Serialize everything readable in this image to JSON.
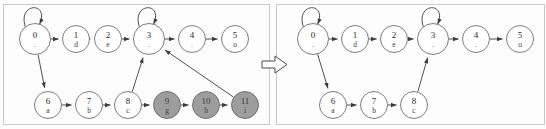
{
  "figure": {
    "title": "",
    "transition_symbol": "right-arrow",
    "panels": [
      {
        "id": "before",
        "name": "left-panel",
        "nodes": [
          {
            "id": "0",
            "label": "0",
            "sub": ".",
            "x": 31,
            "y": 34,
            "r": 15.5,
            "gray": false,
            "self_loop": true
          },
          {
            "id": "1",
            "label": "1",
            "sub": "d",
            "x": 72,
            "y": 34,
            "r": 13.5,
            "gray": false,
            "self_loop": false
          },
          {
            "id": "2",
            "label": "2",
            "sub": "e",
            "x": 104,
            "y": 34,
            "r": 13.5,
            "gray": false,
            "self_loop": false
          },
          {
            "id": "3",
            "label": "3",
            "sub": ".",
            "x": 145,
            "y": 34,
            "r": 15.5,
            "gray": false,
            "self_loop": true
          },
          {
            "id": "4",
            "label": "4",
            "sub": ".",
            "x": 188,
            "y": 34,
            "r": 13.5,
            "gray": false,
            "self_loop": false
          },
          {
            "id": "5",
            "label": "5",
            "sub": "o",
            "x": 231,
            "y": 34,
            "r": 13.5,
            "gray": false,
            "self_loop": false
          },
          {
            "id": "6",
            "label": "6",
            "sub": "a",
            "x": 44,
            "y": 100,
            "r": 13.5,
            "gray": false,
            "self_loop": false
          },
          {
            "id": "7",
            "label": "7",
            "sub": "b",
            "x": 85,
            "y": 100,
            "r": 13.5,
            "gray": false,
            "self_loop": false
          },
          {
            "id": "8",
            "label": "8",
            "sub": "c",
            "x": 124,
            "y": 100,
            "r": 13.5,
            "gray": false,
            "self_loop": false
          },
          {
            "id": "9",
            "label": "9",
            "sub": "g",
            "x": 163,
            "y": 100,
            "r": 13.5,
            "gray": true,
            "self_loop": false
          },
          {
            "id": "10",
            "label": "10",
            "sub": "h",
            "x": 202,
            "y": 100,
            "r": 13.5,
            "gray": true,
            "self_loop": false
          },
          {
            "id": "11",
            "label": "11",
            "sub": "i",
            "x": 241,
            "y": 100,
            "r": 13.5,
            "gray": true,
            "self_loop": false
          }
        ],
        "edges": [
          {
            "from": "0",
            "to": "1"
          },
          {
            "from": "1",
            "to": "2"
          },
          {
            "from": "2",
            "to": "3"
          },
          {
            "from": "3",
            "to": "4"
          },
          {
            "from": "4",
            "to": "5"
          },
          {
            "from": "0",
            "to": "6"
          },
          {
            "from": "6",
            "to": "7"
          },
          {
            "from": "7",
            "to": "8"
          },
          {
            "from": "8",
            "to": "3"
          },
          {
            "from": "8",
            "to": "9"
          },
          {
            "from": "9",
            "to": "10"
          },
          {
            "from": "10",
            "to": "11"
          },
          {
            "from": "11",
            "to": "3"
          }
        ]
      },
      {
        "id": "after",
        "name": "right-panel",
        "nodes": [
          {
            "id": "0",
            "label": "0",
            "sub": ".",
            "x": 36,
            "y": 34,
            "r": 15.5,
            "gray": false,
            "self_loop": true
          },
          {
            "id": "1",
            "label": "1",
            "sub": "d",
            "x": 78,
            "y": 34,
            "r": 13.5,
            "gray": false,
            "self_loop": false
          },
          {
            "id": "2",
            "label": "2",
            "sub": "e",
            "x": 117,
            "y": 34,
            "r": 13.5,
            "gray": false,
            "self_loop": false
          },
          {
            "id": "3",
            "label": "3",
            "sub": ".",
            "x": 156,
            "y": 34,
            "r": 15.5,
            "gray": false,
            "self_loop": true
          },
          {
            "id": "4",
            "label": "4",
            "sub": ".",
            "x": 199,
            "y": 34,
            "r": 13.5,
            "gray": false,
            "self_loop": false
          },
          {
            "id": "5",
            "label": "5",
            "sub": "o",
            "x": 243,
            "y": 34,
            "r": 13.5,
            "gray": false,
            "self_loop": false
          },
          {
            "id": "6",
            "label": "6",
            "sub": "a",
            "x": 56,
            "y": 100,
            "r": 13.5,
            "gray": false,
            "self_loop": false
          },
          {
            "id": "7",
            "label": "7",
            "sub": "b",
            "x": 97,
            "y": 100,
            "r": 13.5,
            "gray": false,
            "self_loop": false
          },
          {
            "id": "8",
            "label": "8",
            "sub": "c",
            "x": 137,
            "y": 100,
            "r": 13.5,
            "gray": false,
            "self_loop": false
          }
        ],
        "edges": [
          {
            "from": "0",
            "to": "1"
          },
          {
            "from": "1",
            "to": "2"
          },
          {
            "from": "2",
            "to": "3"
          },
          {
            "from": "3",
            "to": "4"
          },
          {
            "from": "4",
            "to": "5"
          },
          {
            "from": "0",
            "to": "6"
          },
          {
            "from": "6",
            "to": "7"
          },
          {
            "from": "7",
            "to": "8"
          },
          {
            "from": "8",
            "to": "3"
          }
        ]
      }
    ],
    "colors": {
      "node_fill": "#ffffff",
      "node_gray_fill": "#9d9d9d",
      "node_stroke": "#6e6e6e",
      "edge": "#3b3b3b",
      "frame": "#c9c9c9",
      "background": "#fdfdfd"
    }
  }
}
